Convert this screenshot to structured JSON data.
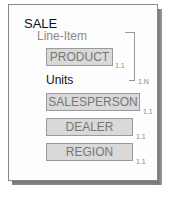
{
  "diagram": {
    "entity": "SALE",
    "group": {
      "label": "Line-Item",
      "cardinality": "1.N"
    },
    "attribute": "Units",
    "components": [
      {
        "name": "PRODUCT",
        "cardinality": "1.1"
      },
      {
        "name": "SALESPERSON",
        "cardinality": "1.1"
      },
      {
        "name": "DEALER",
        "cardinality": "1.1"
      },
      {
        "name": "REGION",
        "cardinality": "1.1"
      }
    ]
  }
}
